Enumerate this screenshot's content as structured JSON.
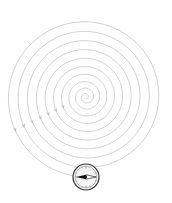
{
  "diagram": {
    "type": "spiral-path",
    "center": [
      86,
      97
    ],
    "turns": 10,
    "colors": {
      "background": "#ffffff",
      "spiral_stroke": "#bdbdbd",
      "arrow_stroke": "#a8a8a8",
      "compass_ring": "#333333",
      "compass_fill": "#f4f4f4",
      "needle_dark": "#111111",
      "needle_light": "#ffffff"
    },
    "compass": {
      "icon": "compass-icon",
      "center": [
        86,
        177
      ],
      "radius": 13
    }
  }
}
